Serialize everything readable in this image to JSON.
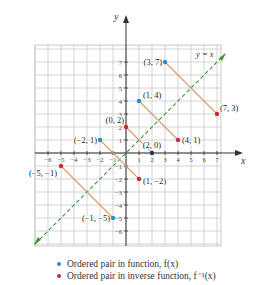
{
  "chart_data": {
    "type": "scatter",
    "title": "",
    "xlabel": "x",
    "ylabel": "y",
    "xlim": [
      -7,
      7.3
    ],
    "ylim": [
      -7.15,
      8.3
    ],
    "x_ticks": [
      -6,
      -5,
      -4,
      -3,
      -2,
      -1,
      1,
      2,
      3,
      4,
      5,
      6,
      7
    ],
    "y_ticks": [
      -6,
      -5,
      -4,
      -3,
      -2,
      -1,
      1,
      2,
      3,
      4,
      5,
      6,
      7
    ],
    "grid": true,
    "reference_line": {
      "label": "y = x",
      "style": "dashed",
      "color": "#3a9a3a"
    },
    "series": [
      {
        "name": "Ordered pair in function, f(x)",
        "color": "#2a8fc0",
        "points": [
          [
            -2,
            1
          ],
          [
            0,
            2
          ]
        ]
      }
    ],
    "function_points": [
      {
        "x": 3,
        "y": 7,
        "label": "(3, 7)"
      },
      {
        "x": 1,
        "y": 4,
        "label": "(1, 4)"
      },
      {
        "x": -2,
        "y": 1,
        "label": "(−2, 1)"
      },
      {
        "x": 2,
        "y": 0,
        "label": "(2, 0)"
      },
      {
        "x": -1,
        "y": -5,
        "label": "(−1, −5)"
      }
    ],
    "inverse_points": [
      {
        "x": 7,
        "y": 3,
        "label": "(7, 3)"
      },
      {
        "x": 4,
        "y": 1,
        "label": "(4, 1)"
      },
      {
        "x": 1,
        "y": -2,
        "label": "(1, −2)"
      },
      {
        "x": 0,
        "y": 2,
        "label": "(0, 2)"
      },
      {
        "x": -5,
        "y": -1,
        "label": "(−5, −1)"
      }
    ],
    "connectors": [
      [
        [
          3,
          7
        ],
        [
          7,
          3
        ]
      ],
      [
        [
          1,
          4
        ],
        [
          4,
          1
        ]
      ],
      [
        [
          -2,
          1
        ],
        [
          1,
          -2
        ]
      ],
      [
        [
          0,
          2
        ],
        [
          2,
          0
        ]
      ],
      [
        [
          -1,
          -5
        ],
        [
          -5,
          -1
        ]
      ]
    ],
    "legend": [
      {
        "label": "Ordered pair in function, f(x)",
        "color": "#2a8fc0"
      },
      {
        "label": "Ordered pair in inverse function, f⁻¹(x)",
        "color": "#c8283c"
      }
    ],
    "legend_position": "bottom"
  },
  "colors": {
    "function": "#2a8fc0",
    "inverse": "#c8283c",
    "connector": "#d89a6a",
    "reference": "#3a9a3a",
    "grid": "#c8c8c8",
    "axis": "#333333"
  },
  "legend": {
    "function_label": "Ordered pair in function, f(x)",
    "inverse_label": "Ordered pair in inverse function, f⁻¹(x)"
  }
}
